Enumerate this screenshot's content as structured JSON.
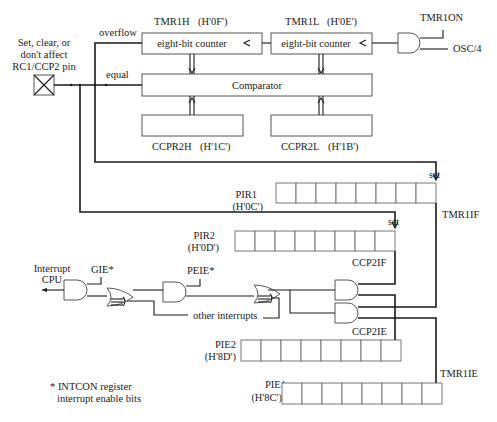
{
  "diagram": {
    "pin_label": [
      "Set, clear, or",
      "don't affect",
      "RC1/CCP2 pin"
    ],
    "signals": {
      "overflow": "overflow",
      "equal": "equal",
      "tmr1on": "TMR1ON",
      "osc": "OSC/4",
      "set1": "set",
      "set2": "set",
      "interrupt_cpu": [
        "Interrupt",
        "CPU"
      ],
      "gie": "GIE*",
      "peie": "PEIE*",
      "other_interrupts": "other interrupts"
    },
    "registers": {
      "tmr1h": {
        "name": "TMR1H",
        "addr": "(H'0F')",
        "body": "eight-bit counter"
      },
      "tmr1l": {
        "name": "TMR1L",
        "addr": "(H'0E')",
        "body": "eight-bit counter"
      },
      "comparator": {
        "body": "Comparator"
      },
      "ccpr2h": {
        "name": "CCPR2H",
        "addr": "(H'1C')"
      },
      "ccpr2l": {
        "name": "CCPR2L",
        "addr": "(H'1B')"
      },
      "pir1": {
        "name": "PIR1",
        "addr": "(H'0C')",
        "bit_label": "TMR1IF",
        "bits": 8
      },
      "pir2": {
        "name": "PIR2",
        "addr": "(H'0D')",
        "bit_label": "CCP2IF",
        "bits": 8
      },
      "pie2": {
        "name": "PIE2",
        "addr": "(H'8D')",
        "bit_label": "CCP2IE",
        "bits": 8
      },
      "pie1": {
        "name": "PIE1",
        "addr": "(H'8C')",
        "bit_label": "TMR1IE",
        "bits": 8
      }
    },
    "footnote": [
      "* INTCON register",
      "interrupt enable bits"
    ]
  }
}
